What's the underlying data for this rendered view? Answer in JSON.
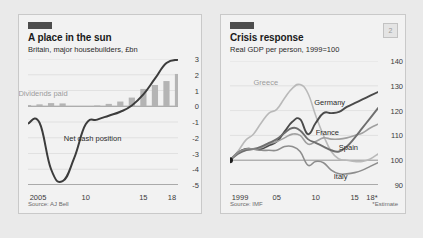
{
  "figure": {
    "background": "#eaeaea",
    "panel_background": "#f2f2f2",
    "marker_color": "#4d4d4d"
  },
  "panels": [
    {
      "id": "place-in-the-sun",
      "badge": "",
      "title": "A place in the sun",
      "subtitle": "Britain, major housebuilders, £bn",
      "source": "Source: AJ Bell",
      "footnote": ""
    },
    {
      "id": "crisis-response",
      "badge": "2",
      "title": "Crisis response",
      "subtitle": "Real GDP per person, 1999=100",
      "source": "Source: IMF",
      "footnote": "*Estimate"
    }
  ],
  "chart_data": [
    {
      "type": "bar",
      "id": "place-in-the-sun",
      "title": "A place in the sun",
      "subtitle": "Britain, major housebuilders, £bn",
      "xlabel": "",
      "ylabel": "£bn",
      "ylim": [
        -5,
        3
      ],
      "yticks": [
        3,
        2,
        1,
        0,
        -1,
        -2,
        -3,
        -4,
        -5
      ],
      "ytick_labels": [
        "3",
        "2",
        "1",
        "0",
        "-1",
        "-2",
        "-3",
        "-4",
        "-5"
      ],
      "xlim": [
        2005,
        2018
      ],
      "xticks": [
        2005,
        2010,
        2015,
        2018
      ],
      "xtick_labels": [
        "2005",
        "10",
        "15",
        "18"
      ],
      "grid": true,
      "legend": "inline-labels",
      "x": [
        2005,
        2006,
        2007,
        2008,
        2009,
        2010,
        2011,
        2012,
        2013,
        2014,
        2015,
        2016,
        2017,
        2018
      ],
      "series": [
        {
          "name": "Dividends paid",
          "type": "bar",
          "color": "#b4b4b4",
          "label_x": 2006.3,
          "label_y": 0.85,
          "values": [
            0.08,
            0.12,
            0.2,
            0.18,
            0.0,
            0.0,
            0.05,
            0.15,
            0.3,
            0.55,
            1.1,
            1.35,
            1.6,
            2.05
          ]
        },
        {
          "name": "Net cash position",
          "type": "line",
          "color": "#3c3c3c",
          "label_x": 2010.6,
          "label_y": -2.0,
          "values": [
            -1.1,
            -1.05,
            -4.0,
            -4.75,
            -3.3,
            -1.15,
            -0.85,
            -0.6,
            -0.35,
            0.05,
            0.75,
            1.75,
            2.75,
            2.95
          ]
        }
      ]
    },
    {
      "type": "line",
      "id": "crisis-response",
      "title": "Crisis response",
      "subtitle": "Real GDP per person, 1999=100",
      "xlabel": "",
      "ylabel": "Index, 1999=100",
      "ylim": [
        90,
        140
      ],
      "yticks": [
        140,
        130,
        120,
        110,
        100,
        90
      ],
      "ytick_labels": [
        "140",
        "130",
        "120",
        "110",
        "100",
        "90"
      ],
      "xlim": [
        1999,
        2018
      ],
      "xticks": [
        1999,
        2005,
        2010,
        2015,
        2018
      ],
      "xtick_labels": [
        "1999",
        "05",
        "10",
        "15",
        "18*"
      ],
      "grid": true,
      "baseline": 100,
      "origin_marker": true,
      "legend": "inline-labels",
      "x": [
        1999,
        2000,
        2001,
        2002,
        2003,
        2004,
        2005,
        2006,
        2007,
        2008,
        2009,
        2010,
        2011,
        2012,
        2013,
        2014,
        2015,
        2016,
        2017,
        2018
      ],
      "series": [
        {
          "name": "Greece",
          "color": "#b9b9b9",
          "label_x": 2003.6,
          "label_y": 131.5,
          "values": [
            100,
            103.5,
            108,
            110.5,
            115,
            119,
            120.5,
            125,
            129,
            130.5,
            127,
            118,
            110,
            103.5,
            100.5,
            100,
            99.5,
            99.5,
            100.5,
            102.5
          ]
        },
        {
          "name": "Germany",
          "color": "#4a4a4a",
          "label_x": 2011.8,
          "label_y": 123.5,
          "values": [
            100,
            103,
            104.5,
            104.5,
            104.5,
            106,
            107.5,
            111.5,
            115.5,
            116.5,
            110.5,
            115,
            119,
            119,
            119.5,
            121.5,
            123,
            124.5,
            126,
            127.5
          ]
        },
        {
          "name": "France",
          "color": "#a0a0a0",
          "label_x": 2011.5,
          "label_y": 111.5,
          "values": [
            100,
            103,
            104,
            104.5,
            105,
            106.5,
            107.5,
            109,
            110.5,
            110,
            106.5,
            107.5,
            109,
            108.5,
            108.5,
            109,
            110,
            111,
            113,
            114.5
          ]
        },
        {
          "name": "Spain",
          "color": "#6e6e6e",
          "label_x": 2014.2,
          "label_y": 105.5,
          "values": [
            100,
            102.5,
            104,
            104.5,
            105.5,
            107,
            108.5,
            111,
            113,
            112,
            108.5,
            107,
            105.5,
            104,
            103.5,
            105.5,
            109,
            113,
            117,
            121
          ]
        },
        {
          "name": "Italy",
          "color": "#8d8d8d",
          "label_x": 2013.2,
          "label_y": 93.5,
          "values": [
            100,
            103,
            104.5,
            104.5,
            104,
            104,
            104,
            105.5,
            105.5,
            103.5,
            98,
            99.5,
            99,
            96,
            94.5,
            94.5,
            95,
            96,
            97.5,
            99
          ]
        }
      ]
    }
  ]
}
